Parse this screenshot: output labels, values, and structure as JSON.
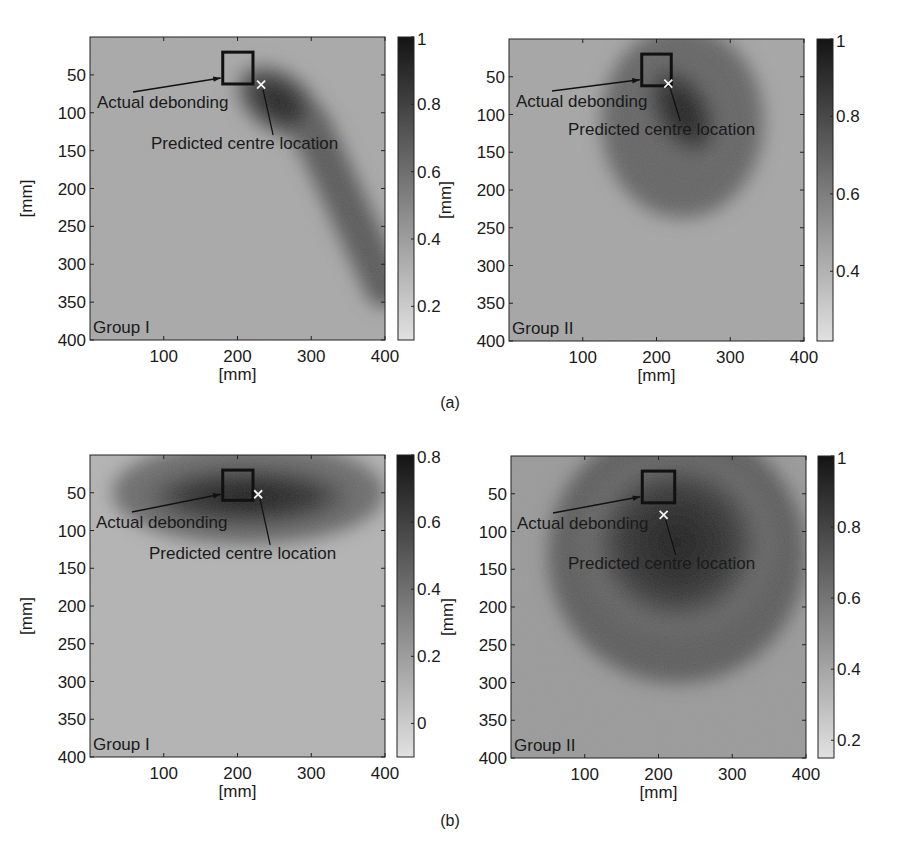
{
  "figure": {
    "panel_labels": [
      "(a)",
      "(b)"
    ]
  },
  "chart_data": [
    {
      "type": "heatmap",
      "panel": "(a)",
      "title": "",
      "group_label": "Group I",
      "xlabel": "[mm]",
      "ylabel": "[mm]",
      "xlim": [
        0,
        400
      ],
      "ylim": [
        400,
        0
      ],
      "x_ticks": [
        100,
        200,
        300,
        400
      ],
      "y_ticks": [
        50,
        100,
        150,
        200,
        250,
        300,
        350,
        400
      ],
      "colormap": "gray (dark = high)",
      "colorbar": {
        "range": [
          0.1,
          1.0
        ],
        "ticks": [
          0.2,
          0.4,
          0.6,
          0.8,
          1
        ],
        "tick_labels": [
          "0.2",
          "0.4",
          "0.6",
          "0.8",
          "1"
        ]
      },
      "background_level": 0.35,
      "features": [
        {
          "kind": "blob",
          "shape": "elongated",
          "center": [
            255,
            85
          ],
          "radii": [
            62,
            40
          ],
          "angle_deg": 35,
          "peak": 0.97
        },
        {
          "kind": "ridge",
          "from": [
            300,
            120
          ],
          "to": [
            400,
            330
          ],
          "width": 55,
          "level": 0.7
        }
      ],
      "actual_debonding": {
        "x": [
          180,
          221
        ],
        "y": [
          20,
          62
        ]
      },
      "predicted_centre": [
        232,
        63
      ],
      "annotations": [
        {
          "text": "Actual debonding",
          "target": "actual_debonding"
        },
        {
          "text": "Predicted centre location",
          "target": "predicted_centre"
        }
      ]
    },
    {
      "type": "heatmap",
      "panel": "(a)",
      "title": "",
      "group_label": "Group II",
      "xlabel": "[mm]",
      "ylabel": "[mm]",
      "xlim": [
        0,
        400
      ],
      "ylim": [
        400,
        0
      ],
      "x_ticks": [
        100,
        200,
        300,
        400
      ],
      "y_ticks": [
        50,
        100,
        150,
        200,
        250,
        300,
        350,
        400
      ],
      "colormap": "gray (dark = high)",
      "colorbar": {
        "range": [
          0.22,
          1.0
        ],
        "ticks": [
          0.4,
          0.6,
          0.8,
          1
        ],
        "tick_labels": [
          "0.4",
          "0.6",
          "0.8",
          "1"
        ]
      },
      "background_level": 0.45,
      "features": [
        {
          "kind": "blob",
          "shape": "comma",
          "center": [
            235,
            95
          ],
          "radii": [
            45,
            75
          ],
          "angle_deg": -30,
          "peak": 0.98
        },
        {
          "kind": "halo",
          "center": [
            235,
            110
          ],
          "radii": [
            110,
            130
          ],
          "level": 0.7
        }
      ],
      "actual_debonding": {
        "x": [
          180,
          220
        ],
        "y": [
          20,
          62
        ]
      },
      "predicted_centre": [
        216,
        59
      ],
      "annotations": [
        {
          "text": "Actual debonding",
          "target": "actual_debonding"
        },
        {
          "text": "Predicted centre location",
          "target": "predicted_centre"
        }
      ]
    },
    {
      "type": "heatmap",
      "panel": "(b)",
      "title": "",
      "group_label": "Group I",
      "xlabel": "[mm]",
      "ylabel": "[mm]",
      "xlim": [
        0,
        400
      ],
      "ylim": [
        400,
        0
      ],
      "x_ticks": [
        100,
        200,
        300,
        400
      ],
      "y_ticks": [
        50,
        100,
        150,
        200,
        250,
        300,
        350,
        400
      ],
      "colormap": "gray (dark = high)",
      "colorbar": {
        "range": [
          -0.1,
          0.8
        ],
        "ticks": [
          0,
          0.2,
          0.4,
          0.6,
          0.8
        ],
        "tick_labels": [
          "0",
          "0.2",
          "0.4",
          "0.6",
          "0.8"
        ]
      },
      "background_level": 0.1,
      "features": [
        {
          "kind": "blob",
          "shape": "ellipse",
          "center": [
            215,
            55
          ],
          "radii": [
            150,
            45
          ],
          "angle_deg": 0,
          "peak": 0.78
        },
        {
          "kind": "halo",
          "center": [
            215,
            50
          ],
          "radii": [
            185,
            70
          ],
          "level": 0.42
        }
      ],
      "actual_debonding": {
        "x": [
          180,
          221
        ],
        "y": [
          20,
          60
        ]
      },
      "predicted_centre": [
        228,
        52
      ],
      "annotations": [
        {
          "text": "Actual debonding",
          "target": "actual_debonding"
        },
        {
          "text": "Predicted centre location",
          "target": "predicted_centre"
        }
      ]
    },
    {
      "type": "heatmap",
      "panel": "(b)",
      "title": "",
      "group_label": "Group II",
      "xlabel": "[mm]",
      "ylabel": "[mm]",
      "xlim": [
        0,
        400
      ],
      "ylim": [
        400,
        0
      ],
      "x_ticks": [
        100,
        200,
        300,
        400
      ],
      "y_ticks": [
        50,
        100,
        150,
        200,
        250,
        300,
        350,
        400
      ],
      "colormap": "gray (dark = high)",
      "colorbar": {
        "range": [
          0.15,
          1.0
        ],
        "ticks": [
          0.2,
          0.4,
          0.6,
          0.8,
          1
        ],
        "tick_labels": [
          "0.2",
          "0.4",
          "0.6",
          "0.8",
          "1"
        ]
      },
      "background_level": 0.45,
      "features": [
        {
          "kind": "blob",
          "shape": "egg",
          "center": [
            225,
            115
          ],
          "radii": [
            125,
            120
          ],
          "angle_deg": 0,
          "peak": 0.97
        },
        {
          "kind": "halo",
          "center": [
            225,
            130
          ],
          "radii": [
            175,
            175
          ],
          "level": 0.7
        }
      ],
      "actual_debonding": {
        "x": [
          178,
          222
        ],
        "y": [
          20,
          62
        ]
      },
      "predicted_centre": [
        207,
        78
      ],
      "annotations": [
        {
          "text": "Actual debonding",
          "target": "actual_debonding"
        },
        {
          "text": "Predicted centre location",
          "target": "predicted_centre"
        }
      ]
    }
  ]
}
